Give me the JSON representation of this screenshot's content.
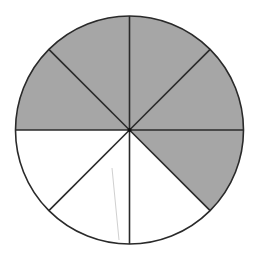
{
  "diagram": {
    "type": "fraction-circle",
    "total_sectors": 8,
    "shaded_sectors": 5,
    "unshaded_sectors": 3,
    "fraction_shaded": "5/8",
    "colors": {
      "shaded": "#a6a6a6",
      "unshaded": "#ffffff",
      "stroke": "#2a2a2a",
      "stray_mark": "#d0d0d0"
    },
    "sectors": [
      {
        "index": 0,
        "from_deg": 0,
        "to_deg": 45,
        "shaded": true
      },
      {
        "index": 1,
        "from_deg": 45,
        "to_deg": 90,
        "shaded": true
      },
      {
        "index": 2,
        "from_deg": 90,
        "to_deg": 135,
        "shaded": true
      },
      {
        "index": 3,
        "from_deg": 135,
        "to_deg": 180,
        "shaded": true
      },
      {
        "index": 4,
        "from_deg": 180,
        "to_deg": 225,
        "shaded": false
      },
      {
        "index": 5,
        "from_deg": 225,
        "to_deg": 270,
        "shaded": false
      },
      {
        "index": 6,
        "from_deg": 270,
        "to_deg": 315,
        "shaded": false
      },
      {
        "index": 7,
        "from_deg": 315,
        "to_deg": 360,
        "shaded": true
      }
    ]
  }
}
